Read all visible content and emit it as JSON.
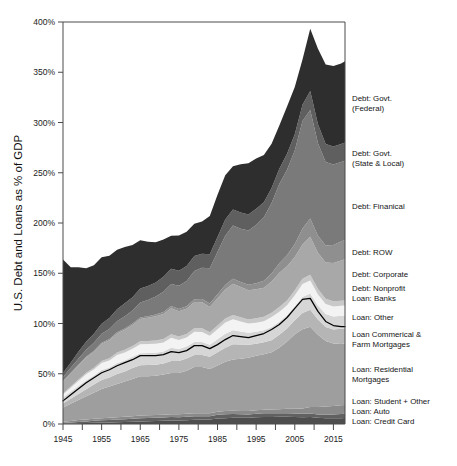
{
  "figure": {
    "y_axis_title": "U.S. Debt and Loans as % of GDP",
    "caption": ""
  },
  "chart_data": {
    "type": "area",
    "stacked": true,
    "title": "",
    "xlabel": "",
    "ylabel": "U.S. Debt and Loans as % of GDP",
    "xlim": [
      1945,
      2018
    ],
    "ylim": [
      0,
      400
    ],
    "ytick_labels": [
      "0%",
      "50%",
      "100%",
      "150%",
      "200%",
      "250%",
      "300%",
      "350%",
      "400%"
    ],
    "ytick_values": [
      0,
      50,
      100,
      150,
      200,
      250,
      300,
      350,
      400
    ],
    "xtick_labels": [
      "1945",
      "1955",
      "1965",
      "1975",
      "1985",
      "1995",
      "2005",
      "2015"
    ],
    "xtick_values": [
      1945,
      1955,
      1965,
      1975,
      1985,
      1995,
      2005,
      2015
    ],
    "xtick_minor": [
      1950,
      1960,
      1970,
      1980,
      1990,
      2000,
      2010
    ],
    "grid": false,
    "legend_position": "right",
    "x": [
      1945,
      1947,
      1949,
      1951,
      1953,
      1955,
      1957,
      1959,
      1961,
      1963,
      1965,
      1967,
      1969,
      1971,
      1973,
      1975,
      1977,
      1979,
      1981,
      1983,
      1985,
      1987,
      1989,
      1991,
      1993,
      1995,
      1997,
      1999,
      2001,
      2003,
      2005,
      2007,
      2009,
      2011,
      2013,
      2015,
      2017,
      2018
    ],
    "series": [
      {
        "name": "Loan: Credit Card",
        "color": "#4e4e4e",
        "values": [
          0.4,
          0.6,
          0.8,
          1.0,
          1.2,
          1.4,
          1.6,
          1.8,
          2.0,
          2.3,
          2.6,
          2.8,
          3.0,
          3.2,
          3.5,
          3.6,
          3.8,
          4.2,
          4.4,
          4.6,
          5.4,
          5.8,
          6.2,
          6.2,
          6.1,
          6.6,
          7.0,
          7.0,
          7.2,
          7.1,
          6.9,
          6.8,
          7.0,
          6.2,
          5.7,
          5.6,
          5.8,
          5.9
        ]
      },
      {
        "name": "Loan: Auto",
        "color": "#616161",
        "values": [
          0.5,
          0.9,
          1.3,
          1.6,
          2.0,
          2.3,
          2.4,
          2.6,
          2.8,
          3.0,
          3.2,
          3.1,
          3.1,
          3.2,
          3.4,
          3.2,
          3.4,
          3.6,
          3.3,
          3.2,
          3.8,
          3.9,
          3.8,
          3.5,
          3.4,
          3.6,
          3.6,
          3.6,
          3.6,
          3.6,
          3.5,
          3.4,
          3.4,
          3.3,
          3.6,
          3.9,
          4.1,
          4.2
        ]
      },
      {
        "name": "Loan: Student + Other",
        "color": "#8a8a8a",
        "values": [
          1.4,
          1.6,
          1.8,
          1.9,
          2.0,
          2.1,
          2.2,
          2.3,
          2.4,
          2.5,
          2.6,
          2.7,
          2.8,
          2.8,
          2.9,
          2.9,
          2.9,
          2.9,
          2.9,
          3.0,
          3.1,
          3.2,
          3.3,
          3.3,
          3.4,
          3.6,
          3.7,
          3.8,
          4.0,
          4.4,
          4.8,
          5.2,
          6.4,
          7.4,
          8.2,
          8.5,
          8.8,
          8.9
        ]
      },
      {
        "name": "Loan: Residential Mortgages",
        "color": "#9e9e9e",
        "values": [
          14,
          17,
          20,
          23,
          26,
          29,
          31,
          33,
          35,
          37,
          39,
          39,
          39,
          40,
          41,
          41,
          43,
          46,
          46,
          44,
          46,
          49,
          51,
          52,
          53,
          54,
          55,
          57,
          61,
          67,
          74,
          79,
          80,
          72,
          65,
          62,
          61,
          61
        ]
      },
      {
        "name": "Loan Commerical & Farm Mortgages",
        "color": "#b5b5b5",
        "values": [
          4,
          5,
          6,
          7,
          8,
          9,
          9,
          10,
          10,
          11,
          11,
          11,
          11,
          11,
          12,
          12,
          12,
          12,
          12,
          12,
          13,
          14,
          15,
          14,
          13,
          12,
          12,
          12,
          13,
          13,
          14,
          16,
          17,
          15,
          14,
          14,
          15,
          15
        ]
      },
      {
        "name": "Loan: Other",
        "color": "#d6d6d6",
        "values": [
          6,
          7,
          8,
          9,
          9,
          10,
          10,
          11,
          11,
          11,
          12,
          12,
          12,
          12,
          13,
          12,
          12,
          13,
          13,
          12,
          13,
          14,
          14,
          13,
          12,
          12,
          12,
          13,
          13,
          13,
          14,
          16,
          16,
          14,
          13,
          13,
          13,
          13
        ]
      },
      {
        "name": "Loan: Banks",
        "color": "#f3f3f3",
        "values": [
          3,
          4,
          5,
          6,
          6,
          7,
          7,
          8,
          8,
          8,
          9,
          9,
          9,
          9,
          10,
          9,
          9,
          10,
          10,
          9,
          10,
          11,
          11,
          10,
          9,
          9,
          9,
          10,
          10,
          10,
          11,
          13,
          13,
          11,
          10,
          10,
          10,
          10
        ]
      },
      {
        "name": "Debt: Nonprofit",
        "color": "#c9c9c9",
        "values": [
          1.0,
          1.2,
          1.4,
          1.6,
          1.8,
          2.0,
          2.2,
          2.4,
          2.6,
          2.8,
          3.0,
          3.1,
          3.2,
          3.3,
          3.4,
          3.4,
          3.5,
          3.6,
          3.6,
          3.6,
          3.8,
          4.0,
          4.2,
          4.2,
          4.2,
          4.3,
          4.3,
          4.4,
          4.6,
          4.8,
          5.0,
          5.2,
          5.6,
          5.4,
          5.2,
          5.1,
          5.0,
          5.0
        ]
      },
      {
        "name": "Debt: Corporate",
        "color": "#a8a8a8",
        "values": [
          12,
          13,
          14,
          15,
          16,
          17,
          18,
          19,
          20,
          21,
          22,
          23,
          24,
          25,
          26,
          25,
          25,
          26,
          26,
          25,
          27,
          29,
          31,
          30,
          29,
          29,
          29,
          31,
          34,
          34,
          33,
          34,
          38,
          36,
          36,
          38,
          40,
          41
        ]
      },
      {
        "name": "Debt: ROW",
        "color": "#8f8f8f",
        "values": [
          0.5,
          0.6,
          0.7,
          0.8,
          0.9,
          1.0,
          1.1,
          1.2,
          1.3,
          1.4,
          1.5,
          1.6,
          1.8,
          2.0,
          2.2,
          2.4,
          2.6,
          2.9,
          3.2,
          3.5,
          4.0,
          4.5,
          5.0,
          5.2,
          5.4,
          6.0,
          7.0,
          8.0,
          9.5,
          11,
          13,
          16,
          18,
          17,
          17,
          18,
          19,
          19
        ]
      },
      {
        "name": "Debt: Finanical",
        "color": "#7a7a7a",
        "values": [
          4,
          5,
          6,
          7,
          8,
          9,
          10,
          11,
          12,
          13,
          15,
          16,
          18,
          20,
          22,
          23,
          25,
          28,
          31,
          35,
          42,
          49,
          53,
          53,
          54,
          58,
          63,
          70,
          79,
          85,
          93,
          107,
          108,
          92,
          83,
          80,
          79,
          79
        ]
      },
      {
        "name": "Debt: Govt. (State & Local)",
        "color": "#5f5f5f",
        "values": [
          4,
          5,
          7,
          8,
          9,
          10,
          11,
          12,
          13,
          13,
          14,
          14,
          14,
          15,
          15,
          15,
          15,
          15,
          14,
          14,
          15,
          16,
          16,
          16,
          16,
          16,
          15,
          15,
          15,
          16,
          16,
          16,
          19,
          19,
          18,
          18,
          18,
          18
        ]
      },
      {
        "name": "Debt: Govt. (Federal)",
        "color": "#2e2e2e",
        "values": [
          113,
          95,
          84,
          73,
          68,
          66,
          62,
          59,
          56,
          52,
          48,
          44,
          40,
          37,
          33,
          35,
          34,
          32,
          32,
          38,
          42,
          44,
          43,
          48,
          51,
          50,
          47,
          44,
          43,
          47,
          47,
          45,
          62,
          75,
          79,
          80,
          80,
          81
        ]
      }
    ],
    "overlay_line": {
      "name": "household-debt-line",
      "color": "#000000",
      "values": [
        23,
        29,
        35,
        41,
        46,
        51,
        54,
        58,
        61,
        64,
        68,
        68,
        68,
        69,
        72,
        71,
        73,
        78,
        78,
        75,
        79,
        84,
        88,
        87,
        86,
        88,
        90,
        94,
        99,
        106,
        115,
        124,
        125,
        112,
        102,
        98,
        97,
        97
      ]
    }
  },
  "legend": [
    {
      "label_lines": [
        "Debt: Govt.",
        "(Federal)"
      ],
      "y": 101
    },
    {
      "label_lines": [
        "Debt: Govt.",
        "(State & Local)"
      ],
      "y": 156
    },
    {
      "label_lines": [
        "Debt: Finanical"
      ],
      "y": 209
    },
    {
      "label_lines": [
        "Debt: ROW"
      ],
      "y": 255
    },
    {
      "label_lines": [
        "Debt: Corporate"
      ],
      "y": 277
    },
    {
      "label_lines": [
        "Debt: Nonprofit"
      ],
      "y": 291
    },
    {
      "label_lines": [
        "Loan: Banks"
      ],
      "y": 301
    },
    {
      "label_lines": [
        "Loan: Other"
      ],
      "y": 320
    },
    {
      "label_lines": [
        "Loan Commerical &",
        "Farm Mortgages"
      ],
      "y": 337
    },
    {
      "label_lines": [
        "Loan: Residential",
        "Mortgages"
      ],
      "y": 372
    },
    {
      "label_lines": [
        "Loan: Student + Other"
      ],
      "y": 404
    },
    {
      "label_lines": [
        "Loan: Auto"
      ],
      "y": 414
    },
    {
      "label_lines": [
        "Loan: Credit Card"
      ],
      "y": 424
    }
  ]
}
